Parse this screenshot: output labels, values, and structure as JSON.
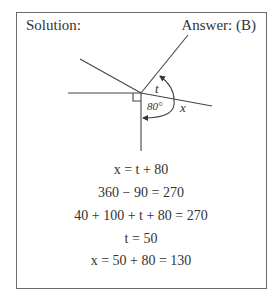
{
  "header": {
    "left_label": "Solution:",
    "right_label": "Answer: (B)"
  },
  "diagram": {
    "labels": {
      "t": "t",
      "angle": "80°",
      "x": "x"
    },
    "line_color": "#333333"
  },
  "equations": [
    "x = t + 80",
    "360 − 90 = 270",
    "40 + 100 + t + 80 = 270",
    "t = 50",
    "x = 50 + 80 = 130"
  ]
}
